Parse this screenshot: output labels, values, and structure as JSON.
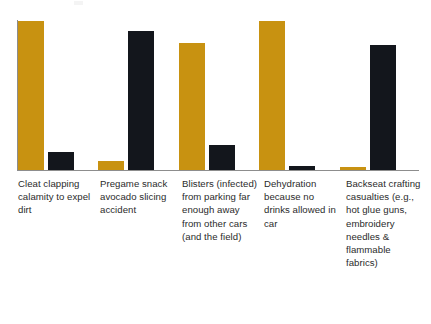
{
  "chart_data": {
    "type": "bar",
    "title": "",
    "subtitle": "",
    "xlabel": "",
    "ylabel": "",
    "ylim": [
      0,
      100
    ],
    "grid": false,
    "legend_position": "none",
    "orientation": "vertical",
    "grouping": "grouped",
    "categories": [
      "Cleat clapping calamity to expel dirt",
      "Pregame snack avocado slicing accident",
      "Blisters (infected) from parking far enough away from other cars (and the field)",
      "Dehydration because no drinks allowed in car",
      "Backseat crafting casualties (e.g., hot glue guns, embroidery needles & flammable fabrics)"
    ],
    "tick_labels": [],
    "series": [
      {
        "name": "Series A",
        "color": "#C89211",
        "values": [
          100,
          6,
          85,
          100,
          2
        ]
      },
      {
        "name": "Series B",
        "color": "#13161C",
        "values": [
          12,
          93,
          17,
          3,
          84
        ]
      }
    ],
    "annotations": []
  },
  "axes": {
    "y_axis_color": "#8d8d8d",
    "x_axis_color": "#8d8d8d",
    "baseline_label": ""
  },
  "colors": {
    "series_a": "#C89211",
    "series_b": "#13161C",
    "axis": "#8d8d8d",
    "text": "#2b2b2b",
    "background": "#ffffff"
  }
}
